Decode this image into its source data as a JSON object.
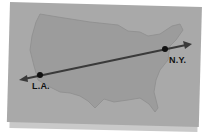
{
  "map": {
    "title": "United States",
    "colors": {
      "card": "#a9a9a9",
      "land": "#9c9c9c",
      "route": "#3a3a3a",
      "marker": "#111111"
    },
    "cities": [
      {
        "name": "L.A.",
        "x": 40,
        "y": 75
      },
      {
        "name": "N.Y.",
        "x": 165,
        "y": 49
      }
    ],
    "route": {
      "from": "L.A.",
      "to": "N.Y.",
      "style": "double-arrow line"
    }
  }
}
